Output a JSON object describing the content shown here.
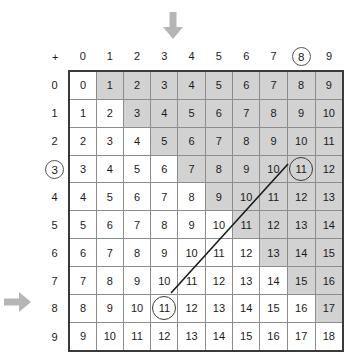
{
  "figure": {
    "kind": "addition-table",
    "corner_symbol": "+",
    "column_headers": [
      "0",
      "1",
      "2",
      "3",
      "4",
      "5",
      "6",
      "7",
      "8",
      "9"
    ],
    "row_headers": [
      "0",
      "1",
      "2",
      "3",
      "4",
      "5",
      "6",
      "7",
      "8",
      "9"
    ],
    "highlighted_column_header": "8",
    "highlighted_row_header": "3",
    "colors": {
      "shade": "#d2d2d2",
      "cell_border": "#8d8d8d",
      "frame": "#3a3a3a",
      "arrow": "#b5b5b5",
      "text": "#1a1a1a"
    },
    "arrows": [
      {
        "name": "column-arrow",
        "direction": "down",
        "points_to": "3"
      },
      {
        "name": "row-arrow",
        "direction": "right",
        "points_to": "8"
      }
    ],
    "circled_cells": [
      {
        "row": "3",
        "col": "8",
        "value": "11"
      },
      {
        "row": "8",
        "col": "3",
        "value": "11"
      }
    ],
    "connector": {
      "from": "11",
      "to": "11",
      "style": "straight-line"
    }
  },
  "chart_data": {
    "type": "table",
    "xlabel": "+",
    "ylabel": "",
    "categories": [
      "0",
      "1",
      "2",
      "3",
      "4",
      "5",
      "6",
      "7",
      "8",
      "9"
    ],
    "row_labels": [
      "0",
      "1",
      "2",
      "3",
      "4",
      "5",
      "6",
      "7",
      "8",
      "9"
    ],
    "shading_rule": "cell shaded when column index > row index",
    "rows": [
      {
        "header": "0",
        "cells": [
          {
            "v": "0",
            "s": false
          },
          {
            "v": "1",
            "s": true
          },
          {
            "v": "2",
            "s": true
          },
          {
            "v": "3",
            "s": true
          },
          {
            "v": "4",
            "s": true
          },
          {
            "v": "5",
            "s": true
          },
          {
            "v": "6",
            "s": true
          },
          {
            "v": "7",
            "s": true
          },
          {
            "v": "8",
            "s": true
          },
          {
            "v": "9",
            "s": true
          }
        ]
      },
      {
        "header": "1",
        "cells": [
          {
            "v": "1",
            "s": false
          },
          {
            "v": "2",
            "s": false
          },
          {
            "v": "3",
            "s": true
          },
          {
            "v": "4",
            "s": true
          },
          {
            "v": "5",
            "s": true
          },
          {
            "v": "6",
            "s": true
          },
          {
            "v": "7",
            "s": true
          },
          {
            "v": "8",
            "s": true
          },
          {
            "v": "9",
            "s": true
          },
          {
            "v": "10",
            "s": true
          }
        ]
      },
      {
        "header": "2",
        "cells": [
          {
            "v": "2",
            "s": false
          },
          {
            "v": "3",
            "s": false
          },
          {
            "v": "4",
            "s": false
          },
          {
            "v": "5",
            "s": true
          },
          {
            "v": "6",
            "s": true
          },
          {
            "v": "7",
            "s": true
          },
          {
            "v": "8",
            "s": true
          },
          {
            "v": "9",
            "s": true
          },
          {
            "v": "10",
            "s": true
          },
          {
            "v": "11",
            "s": true
          }
        ]
      },
      {
        "header": "3",
        "cells": [
          {
            "v": "3",
            "s": false
          },
          {
            "v": "4",
            "s": false
          },
          {
            "v": "5",
            "s": false
          },
          {
            "v": "6",
            "s": false
          },
          {
            "v": "7",
            "s": true
          },
          {
            "v": "8",
            "s": true
          },
          {
            "v": "9",
            "s": true
          },
          {
            "v": "10",
            "s": true
          },
          {
            "v": "11",
            "s": true,
            "circled": true
          },
          {
            "v": "12",
            "s": true
          }
        ]
      },
      {
        "header": "4",
        "cells": [
          {
            "v": "4",
            "s": false
          },
          {
            "v": "5",
            "s": false
          },
          {
            "v": "6",
            "s": false
          },
          {
            "v": "7",
            "s": false
          },
          {
            "v": "8",
            "s": false
          },
          {
            "v": "9",
            "s": true
          },
          {
            "v": "10",
            "s": true
          },
          {
            "v": "11",
            "s": true
          },
          {
            "v": "12",
            "s": true
          },
          {
            "v": "13",
            "s": true
          }
        ]
      },
      {
        "header": "5",
        "cells": [
          {
            "v": "5",
            "s": false
          },
          {
            "v": "6",
            "s": false
          },
          {
            "v": "7",
            "s": false
          },
          {
            "v": "8",
            "s": false
          },
          {
            "v": "9",
            "s": false
          },
          {
            "v": "10",
            "s": false
          },
          {
            "v": "11",
            "s": true
          },
          {
            "v": "12",
            "s": true
          },
          {
            "v": "13",
            "s": true
          },
          {
            "v": "14",
            "s": true
          }
        ]
      },
      {
        "header": "6",
        "cells": [
          {
            "v": "6",
            "s": false
          },
          {
            "v": "7",
            "s": false
          },
          {
            "v": "8",
            "s": false
          },
          {
            "v": "9",
            "s": false
          },
          {
            "v": "10",
            "s": false
          },
          {
            "v": "11",
            "s": false
          },
          {
            "v": "12",
            "s": false
          },
          {
            "v": "13",
            "s": true
          },
          {
            "v": "14",
            "s": true
          },
          {
            "v": "15",
            "s": true
          }
        ]
      },
      {
        "header": "7",
        "cells": [
          {
            "v": "7",
            "s": false
          },
          {
            "v": "8",
            "s": false
          },
          {
            "v": "9",
            "s": false
          },
          {
            "v": "10",
            "s": false
          },
          {
            "v": "11",
            "s": false
          },
          {
            "v": "12",
            "s": false
          },
          {
            "v": "13",
            "s": false
          },
          {
            "v": "14",
            "s": false
          },
          {
            "v": "15",
            "s": true
          },
          {
            "v": "16",
            "s": true
          }
        ]
      },
      {
        "header": "8",
        "cells": [
          {
            "v": "8",
            "s": false
          },
          {
            "v": "9",
            "s": false
          },
          {
            "v": "10",
            "s": false
          },
          {
            "v": "11",
            "s": false,
            "circled": true
          },
          {
            "v": "12",
            "s": false
          },
          {
            "v": "13",
            "s": false
          },
          {
            "v": "14",
            "s": false
          },
          {
            "v": "15",
            "s": false
          },
          {
            "v": "16",
            "s": false
          },
          {
            "v": "17",
            "s": true
          }
        ]
      },
      {
        "header": "9",
        "cells": [
          {
            "v": "9",
            "s": false
          },
          {
            "v": "10",
            "s": false
          },
          {
            "v": "11",
            "s": false
          },
          {
            "v": "12",
            "s": false
          },
          {
            "v": "13",
            "s": false
          },
          {
            "v": "14",
            "s": false
          },
          {
            "v": "15",
            "s": false
          },
          {
            "v": "16",
            "s": false
          },
          {
            "v": "17",
            "s": false
          },
          {
            "v": "18",
            "s": false
          }
        ]
      }
    ]
  }
}
